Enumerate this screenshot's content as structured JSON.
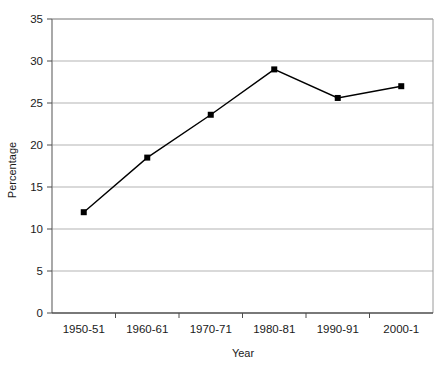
{
  "chart_data": {
    "type": "line",
    "title": "",
    "xlabel": "Year",
    "ylabel": "Percentage",
    "categories": [
      "1950-51",
      "1960-61",
      "1970-71",
      "1980-81",
      "1990-91",
      "2000-1"
    ],
    "values": [
      12.0,
      18.5,
      23.6,
      29.0,
      25.6,
      27.0
    ],
    "series": [
      {
        "name": "Percentage",
        "values": [
          12.0,
          18.5,
          23.6,
          29.0,
          25.6,
          27.0
        ]
      }
    ],
    "ylim": [
      0,
      35
    ],
    "yticks": [
      0,
      5,
      10,
      15,
      20,
      25,
      30,
      35
    ],
    "ytick_labels": [
      "0",
      "5",
      "10",
      "15",
      "20",
      "25",
      "30",
      "35"
    ],
    "grid": "horizontal",
    "legend": "none",
    "line_color": "#000000",
    "marker": "square",
    "marker_color": "#000000",
    "grid_color": "#b3b3b3",
    "axis_color": "#808080",
    "plot_background": "#ffffff"
  }
}
